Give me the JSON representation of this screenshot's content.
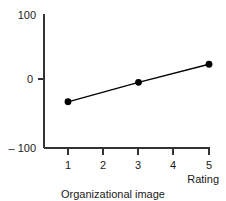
{
  "chart_data": {
    "type": "line",
    "title": "",
    "subtitle": "",
    "caption": "Organizational image",
    "xlabel": "Rating",
    "ylabel": "",
    "x": [
      1,
      3,
      5
    ],
    "values": [
      -31,
      -2,
      25
    ],
    "series": [
      {
        "name": "Organizational image",
        "x": [
          1,
          3,
          5
        ],
        "values": [
          -31,
          -2,
          25
        ]
      }
    ],
    "xlim": [
      0.5,
      5.4
    ],
    "ylim": [
      -100,
      100
    ],
    "xticks": [
      1,
      2,
      3,
      4,
      5
    ],
    "xtick_labels": [
      "1",
      "2",
      "3",
      "4",
      "5"
    ],
    "yticks": [
      -100,
      0,
      100
    ],
    "ytick_labels": [
      "– 100",
      "0",
      "100"
    ],
    "grid": false,
    "legend": false,
    "legend_position": "none",
    "marker": "filled-circle",
    "line_color": "#000000",
    "marker_color": "#000000",
    "axis_color": "#333333",
    "background_color": "#ffffff"
  },
  "axes": {
    "y_axis_name": "value-axis",
    "x_axis_name": "rating-axis"
  }
}
